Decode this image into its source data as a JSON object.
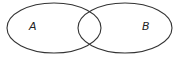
{
  "diagram": {
    "type": "venn",
    "sets": [
      {
        "label": "A",
        "cx": 54,
        "cy": 28,
        "rx": 47,
        "ry": 25
      },
      {
        "label": "B",
        "cx": 125,
        "cy": 28,
        "rx": 47,
        "ry": 25
      }
    ],
    "stroke_color": "#333333",
    "background": "#ffffff"
  }
}
